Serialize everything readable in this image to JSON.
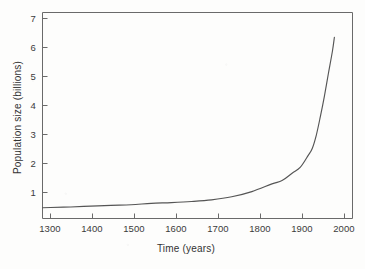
{
  "figure": {
    "background_color": "#fdfdfc",
    "line_color": "#555555",
    "axis_color": "#666666",
    "text_color": "#333333"
  },
  "axes": {
    "x_title": "Time (years)",
    "y_title": "Population size (billions)",
    "x_ticks": [
      "1300",
      "1400",
      "1500",
      "1600",
      "1700",
      "1800",
      "1900",
      "2000"
    ],
    "y_ticks": [
      "1",
      "2",
      "3",
      "4",
      "5",
      "6",
      "7"
    ]
  },
  "chart_data": {
    "type": "line",
    "title": "",
    "subtitle": "",
    "xlabel": "Time (years)",
    "ylabel": "Population size (billions)",
    "xlim": [
      1280,
      2050
    ],
    "ylim": [
      0,
      7.5
    ],
    "xticks": [
      1300,
      1400,
      1500,
      1600,
      1700,
      1800,
      1900,
      2000
    ],
    "yticks": [
      1,
      2,
      3,
      4,
      5,
      6,
      7
    ],
    "grid": false,
    "legend": null,
    "legend_position": "none",
    "tick_direction": "in",
    "series": [
      {
        "name": "World population",
        "color": "#555555",
        "x": [
          1280,
          1300,
          1350,
          1400,
          1450,
          1500,
          1550,
          1600,
          1650,
          1700,
          1750,
          1800,
          1850,
          1875,
          1900,
          1920,
          1940,
          1950,
          1960,
          1970,
          1980,
          1990,
          2000,
          2005
        ],
        "y": [
          0.39,
          0.4,
          0.42,
          0.45,
          0.48,
          0.5,
          0.55,
          0.58,
          0.62,
          0.68,
          0.79,
          0.98,
          1.26,
          1.38,
          1.65,
          1.86,
          2.3,
          2.55,
          3.03,
          3.7,
          4.44,
          5.27,
          6.08,
          6.6
        ]
      }
    ],
    "annotations": []
  }
}
